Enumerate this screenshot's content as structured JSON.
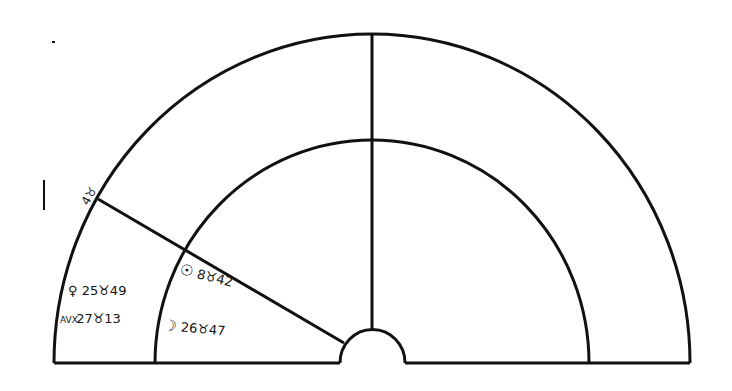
{
  "diagram": {
    "type": "astrological-half-chart",
    "colors": {
      "line": "#111111",
      "background": "#ffffff"
    },
    "cusp_label": {
      "text": "4♉",
      "degree": "4",
      "sign": "♉"
    },
    "placements": [
      {
        "planet": "Venus",
        "symbol": "♀",
        "text": "25♉49"
      },
      {
        "planet": "Ascendant",
        "symbol": "AVX",
        "text": "27♉13"
      },
      {
        "planet": "Sun",
        "symbol": "☉",
        "text": "8♉42"
      },
      {
        "planet": "Moon",
        "symbol": "☽",
        "text": "26♉47"
      }
    ]
  }
}
